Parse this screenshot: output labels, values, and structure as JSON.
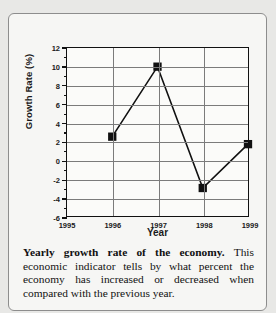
{
  "chart_data": {
    "type": "line",
    "title": "",
    "xlabel": "Year",
    "ylabel": "Growth Rate (%)",
    "x": [
      1995,
      1996,
      1997,
      1998,
      1999
    ],
    "categories": [
      "1995",
      "1996",
      "1997",
      "1998",
      "1999"
    ],
    "values": [
      null,
      2.5,
      10.0,
      -3.0,
      1.7
    ],
    "series": [
      {
        "name": "Growth Rate (%)",
        "points": [
          {
            "x": 1996,
            "y": 2.5
          },
          {
            "x": 1997,
            "y": 10.0
          },
          {
            "x": 1998,
            "y": -3.0
          },
          {
            "x": 1999,
            "y": 1.7
          }
        ]
      }
    ],
    "xlim": [
      1995,
      1999
    ],
    "ylim": [
      -6,
      12
    ],
    "ytick_step": 2,
    "yticks": [
      12,
      10,
      8,
      6,
      4,
      2,
      0,
      -2,
      -4,
      -6
    ],
    "ytick_labels": [
      "12",
      "10",
      "8",
      "6",
      "4",
      "2",
      "0",
      "-2",
      "-4",
      "-6"
    ],
    "xticks": [
      1995,
      1996,
      1997,
      1998,
      1999
    ],
    "xtick_labels": [
      "1995",
      "1996",
      "1997",
      "1998",
      "1999"
    ],
    "grid": true,
    "legend": false,
    "marker": "square",
    "line_color": "#111111",
    "marker_color": "#111111",
    "grid_color": "#7b7b7b",
    "frame_color": "#111111"
  },
  "caption": {
    "lead": "Yearly growth rate of the economy.",
    "body": "This economic indicator tells by what percent the economy has increased or decreased when compared with the previous year."
  }
}
